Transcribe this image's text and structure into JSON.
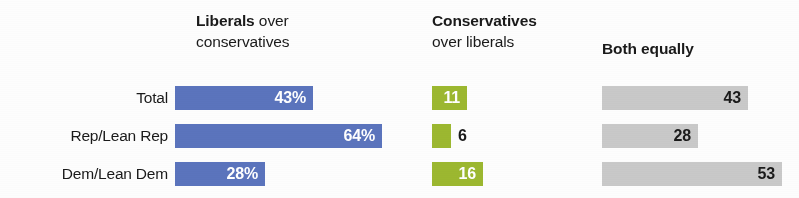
{
  "chart_data": {
    "type": "bar",
    "title": "",
    "subtitle": "",
    "xlabel": "",
    "ylabel": "",
    "grid": false,
    "legend_position": "top-as-column-headers",
    "orientation": "horizontal",
    "categories": [
      "Total",
      "Rep/Lean Rep",
      "Dem/Lean Dem"
    ],
    "axis_max": 100,
    "series": [
      {
        "name": "Liberals over conservatives",
        "color": "#5b74bd",
        "values": [
          43,
          64,
          28
        ],
        "value_labels": [
          "43%",
          "64%",
          "28%"
        ],
        "label_placement": [
          "inside",
          "inside",
          "inside"
        ]
      },
      {
        "name": "Conservatives over liberals",
        "color": "#9cb830",
        "values": [
          11,
          6,
          16
        ],
        "value_labels": [
          "11",
          "6",
          "16"
        ],
        "label_placement": [
          "inside",
          "outside",
          "inside"
        ]
      },
      {
        "name": "Both equally",
        "color": "#c9c9c9",
        "values": [
          43,
          28,
          53
        ],
        "value_labels": [
          "43",
          "28",
          "53"
        ],
        "label_placement": [
          "inside",
          "inside",
          "inside"
        ]
      }
    ]
  },
  "headers": {
    "liberals": {
      "strong": "Liberals",
      "light": " over",
      "line2": "conservatives"
    },
    "conservatives": {
      "strong": "Conservatives",
      "line2": "over liberals"
    },
    "both": {
      "strong": "Both equally"
    }
  },
  "rows": [
    {
      "label": "Total",
      "blue": {
        "value": "43%",
        "width_px": 138
      },
      "green": {
        "value": "11",
        "width_px": 35
      },
      "gray": {
        "value": "43",
        "width_px": 146
      }
    },
    {
      "label": "Rep/Lean Rep",
      "blue": {
        "value": "64%",
        "width_px": 207
      },
      "green": {
        "value": "6",
        "width_px": 19
      },
      "gray": {
        "value": "28",
        "width_px": 96
      }
    },
    {
      "label": "Dem/Lean Dem",
      "blue": {
        "value": "28%",
        "width_px": 90
      },
      "green": {
        "value": "16",
        "width_px": 51
      },
      "gray": {
        "value": "53",
        "width_px": 180
      }
    }
  ],
  "colors": {
    "blue": "#5b74bd",
    "green": "#9cb830",
    "gray": "#c9c9c9",
    "text": "#1a1a1a",
    "value_on_bar": "#ffffff"
  }
}
